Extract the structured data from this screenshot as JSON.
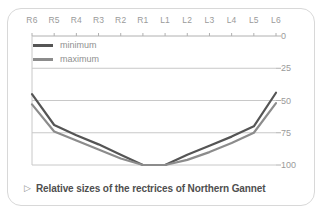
{
  "caption": {
    "marker": "▷",
    "text": "Relative sizes of the rectrices of Northern Gannet"
  },
  "legend": {
    "position": "top-left-inside",
    "items": [
      {
        "label": "minimum",
        "color": "#555555"
      },
      {
        "label": "maximum",
        "color": "#8c8c8c"
      }
    ]
  },
  "colors": {
    "frame_border": "#d8d8d8",
    "gridline": "#c8c8c8",
    "axis": "#b0b0b0",
    "tick_text": "#9a9a9a",
    "caption_text": "#4f4f4f",
    "minimum_line": "#555555",
    "maximum_line": "#8c8c8c",
    "background": "#ffffff"
  },
  "chart_data": {
    "type": "line",
    "title": "Relative sizes of the rectrices of Northern Gannet",
    "xlabel": "",
    "ylabel": "",
    "categories": [
      "R6",
      "R5",
      "R4",
      "R3",
      "R2",
      "R1",
      "L1",
      "L2",
      "L3",
      "L4",
      "L5",
      "L6"
    ],
    "ylim": [
      0,
      100
    ],
    "y_inverted": true,
    "y_ticks": [
      0,
      25,
      50,
      75,
      100
    ],
    "x_axis_position": "top",
    "y_axis_position": "right",
    "grid": true,
    "series": [
      {
        "name": "minimum",
        "color": "#555555",
        "values": [
          45,
          69,
          77,
          84,
          92,
          100,
          100,
          92,
          85,
          78,
          70,
          44
        ]
      },
      {
        "name": "maximum",
        "color": "#8c8c8c",
        "values": [
          53,
          74,
          81,
          88,
          95,
          100,
          100,
          96,
          90,
          83,
          75,
          52
        ]
      }
    ]
  }
}
